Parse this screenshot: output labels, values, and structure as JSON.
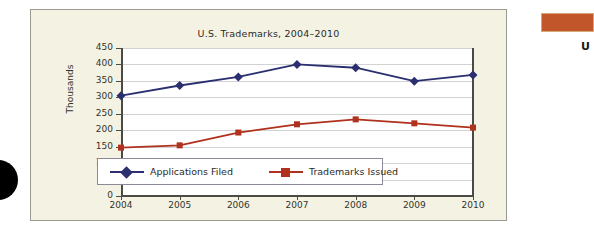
{
  "chart_data": {
    "type": "line",
    "title": "U.S. Trademarks, 2004–2010",
    "xlabel": "",
    "ylabel": "Thousands",
    "categories": [
      "2004",
      "2005",
      "2006",
      "2007",
      "2008",
      "2009",
      "2010"
    ],
    "ylim": [
      0,
      450
    ],
    "ytick_labels": [
      "450",
      "400",
      "350",
      "300",
      "250",
      "200",
      "150",
      "100",
      "50",
      "0"
    ],
    "ytick_values": [
      450,
      400,
      350,
      300,
      250,
      200,
      150,
      100,
      50,
      0
    ],
    "grid": true,
    "legend_position": "inside-bottom-left",
    "series": [
      {
        "name": "Applications Filed",
        "color": "#2b2f70",
        "marker": "diamond",
        "values": [
          305,
          336,
          362,
          400,
          390,
          349,
          368
        ]
      },
      {
        "name": "Trademarks Issued",
        "color": "#b0311e",
        "marker": "square",
        "values": [
          147,
          154,
          193,
          218,
          233,
          221,
          208
        ]
      }
    ]
  },
  "figure": {
    "panel_background": "#f4f3e3",
    "panel_border": "#9a9a91",
    "plot_background": "#ffffff",
    "gridline_color": "#d2d2d2",
    "axis_color": "#4a4a46"
  },
  "decor": {
    "right_bar_color": "#c0562a",
    "right_letter": "U",
    "corner_dot_color": "#000000"
  }
}
